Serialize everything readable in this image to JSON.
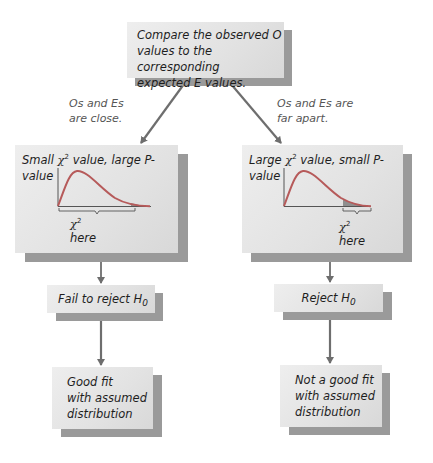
{
  "top_box": {
    "line1": "Compare the observed O",
    "line2": "values to the corresponding",
    "line3": "expected E values."
  },
  "branch_left": {
    "edge_label_line1": "Os and Es",
    "edge_label_line2": "are close.",
    "title_prefix": "Small ",
    "chi_symbol": "χ",
    "chi_sup": "2",
    "title_suffix": " value, large P-value",
    "axis_label_chi": "χ",
    "axis_label_sup": "2",
    "axis_label_text": " here",
    "decision_text": "Fail to reject H",
    "decision_sub": "0",
    "conclusion_line1": "Good fit",
    "conclusion_line2": "with assumed",
    "conclusion_line3": "distribution"
  },
  "branch_right": {
    "edge_label_line1": "Os and Es are",
    "edge_label_line2": "far apart.",
    "title_prefix": "Large ",
    "chi_symbol": "χ",
    "chi_sup": "2",
    "title_suffix": " value, small P-value",
    "axis_label_chi": "χ",
    "axis_label_sup": "2",
    "axis_label_text": " here",
    "decision_text": "Reject H",
    "decision_sub": "0",
    "conclusion_line1": "Not a good fit",
    "conclusion_line2": "with assumed",
    "conclusion_line3": "distribution"
  },
  "colors": {
    "curve": "#b65a5a",
    "tail_shade": "#8f8f8f",
    "arrow": "#6e6e6e",
    "box_face": "#e6e6e6",
    "box_shadow": "#9a9a9a"
  }
}
